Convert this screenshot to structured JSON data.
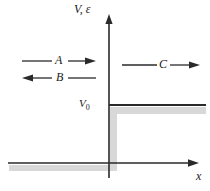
{
  "figure": {
    "background_color": "#ffffff",
    "line_color": "#2a2a2a",
    "shadow_color": "#d4d4d4"
  },
  "axes": {
    "y_label": "V, ε",
    "x_label": "x",
    "origin_x": 109,
    "origin_y": 163,
    "y_axis_top": 16,
    "x_axis_left": 8,
    "x_axis_right": 196
  },
  "levels": {
    "v0_label": "V",
    "v0_subscript": "0",
    "v0_y": 105,
    "step_right_end": 205
  },
  "arrows": [
    {
      "name": "incident-wave-arrow",
      "label": "A",
      "direction": "right",
      "x_start": 22,
      "x_end": 96,
      "y": 61
    },
    {
      "name": "reflected-wave-arrow",
      "label": "B",
      "direction": "left",
      "x_start": 96,
      "x_end": 22,
      "y": 78
    },
    {
      "name": "transmitted-wave-arrow",
      "label": "C",
      "direction": "right",
      "x_start": 122,
      "x_end": 200,
      "y": 65
    }
  ]
}
